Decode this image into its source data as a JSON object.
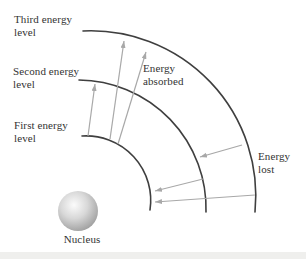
{
  "figure": {
    "labels": {
      "third_level": "Third energy\nlevel",
      "second_level": "Second energy\nlevel",
      "first_level": "First energy\nlevel",
      "energy_absorbed": "Energy\nabsorbed",
      "energy_lost": "Energy\nlost",
      "nucleus": "Nucleus"
    },
    "colors": {
      "arc": "#3f3f3f",
      "arrow": "#a8a8a8",
      "text": "#333333",
      "background": "#ffffff",
      "nucleus_highlight": "#fbfbfb",
      "nucleus_mid": "#d8d8d8",
      "nucleus_edge": "#959595"
    },
    "arcs": [
      {
        "name": "first-energy-level-arc",
        "path": "M 82 136 A 64.5 64.5 0 0 1 150 210"
      },
      {
        "name": "second-energy-level-arc",
        "path": "M 79 80 A 128.5 128.5 0 0 1 206 212"
      },
      {
        "name": "third-energy-level-arc",
        "path": "M 83 31 A 165 165 0 0 1 255 212"
      }
    ],
    "arrows": {
      "absorbed": [
        {
          "from_level": 1,
          "to_level": 2,
          "x1": 88,
          "y1": 136,
          "x2": 95,
          "y2": 84
        },
        {
          "from_level": 1,
          "to_level": 3,
          "x1": 110,
          "y1": 139,
          "x2": 124,
          "y2": 41
        },
        {
          "from_level": 1,
          "to_level": 3,
          "x1": 118,
          "y1": 144,
          "x2": 146,
          "y2": 52
        }
      ],
      "lost": [
        {
          "from_level": 3,
          "to_level": 2,
          "x1": 242,
          "y1": 145,
          "x2": 200,
          "y2": 157
        },
        {
          "from_level": 2,
          "to_level": 1,
          "x1": 203,
          "y1": 179,
          "x2": 155,
          "y2": 191
        },
        {
          "from_level": 3,
          "to_level": 1,
          "x1": 255,
          "y1": 195,
          "x2": 155,
          "y2": 202
        }
      ]
    },
    "nucleus_sphere": {
      "cx": 78,
      "cy": 211,
      "r": 20
    }
  }
}
